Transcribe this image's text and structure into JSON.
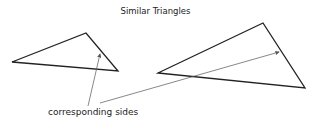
{
  "diagram": {
    "title": "Similar Triangles",
    "annotation": "corresponding sides",
    "colors": {
      "stroke": "#222222",
      "arrow": "#555555",
      "background": "#ffffff"
    },
    "shapes": [
      {
        "id": "small-triangle",
        "type": "triangle",
        "points": [
          [
            12,
            62
          ],
          [
            86,
            33
          ],
          [
            118,
            71
          ]
        ]
      },
      {
        "id": "large-triangle",
        "type": "triangle",
        "points": [
          [
            158,
            73
          ],
          [
            263,
            23
          ],
          [
            305,
            88
          ]
        ]
      }
    ],
    "arrows": [
      {
        "id": "arrow-to-small",
        "from": [
          88,
          106
        ],
        "to": [
          100,
          53
        ]
      },
      {
        "id": "arrow-to-large",
        "from": [
          100,
          103
        ],
        "to": [
          280,
          52
        ]
      }
    ]
  }
}
